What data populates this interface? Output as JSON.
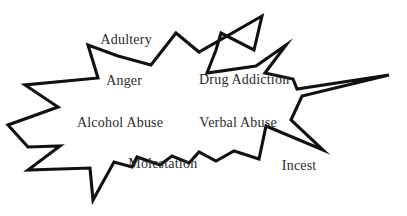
{
  "diagram": {
    "type": "starburst",
    "title": "",
    "background_color": "#ffffff",
    "outline_color": "#111111",
    "outline_width": 3.1,
    "fill_color": "#ffffff",
    "label_color": "#2b2b2b",
    "labels": [
      {
        "text": "Adultery",
        "x": 31.0,
        "y": 18.5
      },
      {
        "text": "Anger",
        "x": 30.5,
        "y": 37.5
      },
      {
        "text": "Drug Addiction",
        "x": 60.0,
        "y": 37.0
      },
      {
        "text": "Alcohol Abuse",
        "x": 29.5,
        "y": 57.0
      },
      {
        "text": "Verbal Abuse",
        "x": 58.5,
        "y": 57.0
      },
      {
        "text": "Molestation",
        "x": 40.0,
        "y": 76.0
      },
      {
        "text": "Incest",
        "x": 73.5,
        "y": 77.0
      }
    ],
    "outline_points": "262,16 254,50 221,33 216,50 207,73 256,66 286,45 265,73 293,79 297,89 389,75 302,96 291,120 323,150 266,126 262,145 259,159 234,151 216,161 199,152 189,163 172,156 160,165 137,157 132,167 114,162 93,200 90,168 28,170 60,146 28,147 8,125 58,107 25,85 98,78 88,45 118,56 151,65 176,33 199,52"
  }
}
